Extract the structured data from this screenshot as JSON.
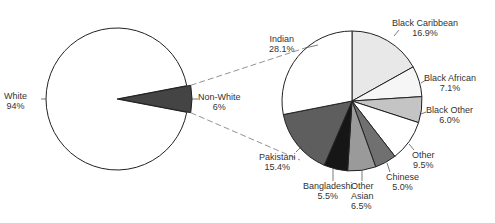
{
  "chart_data": [
    {
      "type": "pie",
      "title": "",
      "categories": [
        "White",
        "Non-White"
      ],
      "values": [
        94,
        6
      ],
      "labels": [
        "White\n94%",
        "Non-White\n6%"
      ],
      "start_angle_deg": 0,
      "direction": "clockwise",
      "colors": [
        "#ffffff",
        "#444444"
      ]
    },
    {
      "type": "pie",
      "title": "",
      "note": "Breakdown of Non-White slice",
      "categories": [
        "Black Caribbean",
        "Black African",
        "Black Other",
        "Other",
        "Chinese",
        "Other Asian",
        "Bangladeshi",
        "Pakistani",
        "Indian"
      ],
      "values": [
        16.9,
        7.1,
        6.0,
        9.5,
        5.0,
        6.5,
        5.5,
        15.4,
        28.1
      ],
      "start_angle_deg": 0,
      "direction": "clockwise",
      "colors": [
        "#e8e8e8",
        "#f6f6f6",
        "#c4c4c4",
        "#ffffff",
        "#707070",
        "#9a9a9a",
        "#161616",
        "#5e5e5e",
        "#ffffff"
      ]
    }
  ],
  "labels": {
    "white": {
      "name": "White",
      "pct": "94%"
    },
    "nonwhite": {
      "name": "Non-White",
      "pct": "6%"
    },
    "black_caribbean": {
      "name": "Black Caribbean",
      "pct": "16.9%"
    },
    "black_african": {
      "name": "Black African",
      "pct": "7.1%"
    },
    "black_other": {
      "name": "Black Other",
      "pct": "6.0%"
    },
    "other": {
      "name": "Other",
      "pct": "9.5%"
    },
    "chinese": {
      "name": "Chinese",
      "pct": "5.0%"
    },
    "other_asian": {
      "name1": "Other",
      "name2": "Asian",
      "pct": "6.5%"
    },
    "bangladeshi": {
      "name": "Bangladeshi",
      "pct": "5.5%"
    },
    "pakistani": {
      "name": "Pakistani",
      "pct": "15.4%"
    },
    "indian": {
      "name": "Indian",
      "pct": "28.1%"
    }
  }
}
